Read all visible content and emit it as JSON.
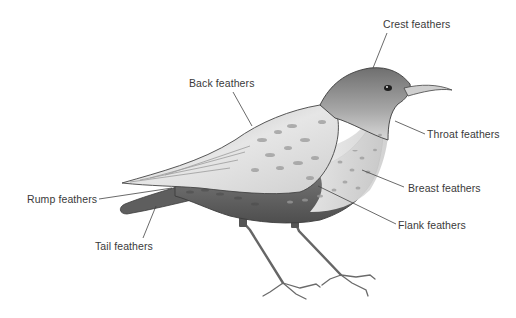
{
  "figure": {
    "style": "grayscale pencil drawing",
    "colors": {
      "background": "#ffffff",
      "label_text": "#3a3a3a",
      "leader_line": "#444444",
      "body_dark": "#5a5a5a",
      "body_mid": "#8c8c8c",
      "body_light": "#d6d6d6"
    },
    "labels": [
      {
        "id": "crest",
        "text": "Crest feathers"
      },
      {
        "id": "back",
        "text": "Back feathers"
      },
      {
        "id": "throat",
        "text": "Throat feathers"
      },
      {
        "id": "breast",
        "text": "Breast feathers"
      },
      {
        "id": "flank",
        "text": "Flank feathers"
      },
      {
        "id": "rump",
        "text": "Rump feathers"
      },
      {
        "id": "tail",
        "text": "Tail feathers"
      }
    ]
  }
}
